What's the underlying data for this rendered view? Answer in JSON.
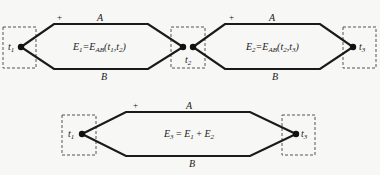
{
  "colors": {
    "wire": "#1a1a1a",
    "box_dash": "#555555",
    "background": "#f7f7f5"
  },
  "thermocouples": [
    {
      "id": "top-left",
      "wire_top": "A",
      "wire_bottom": "B",
      "polarity": "+",
      "equation": {
        "lhs": "E",
        "lhs_sub": "1",
        "rhs": "E",
        "rhs_sub": "AB",
        "args": [
          "t",
          "1",
          "t",
          "2"
        ]
      },
      "junctions": [
        {
          "label": "t",
          "sub": "1"
        },
        {
          "label": "t",
          "sub": "2"
        }
      ]
    },
    {
      "id": "top-right",
      "wire_top": "A",
      "wire_bottom": "B",
      "polarity": "+",
      "equation": {
        "lhs": "E",
        "lhs_sub": "2",
        "rhs": "E",
        "rhs_sub": "AB",
        "args": [
          "t",
          "2",
          "t",
          "3"
        ]
      },
      "junctions": [
        {
          "label": "t",
          "sub": "2"
        },
        {
          "label": "t",
          "sub": "3"
        }
      ]
    },
    {
      "id": "bottom",
      "wire_top": "A",
      "wire_bottom": "B",
      "polarity": "+",
      "equation": {
        "text_lhs": "E",
        "lhs_sub": "3",
        "term1": "E",
        "term1_sub": "1",
        "term2": "E",
        "term2_sub": "2",
        "equals": " = ",
        "plus": " + "
      },
      "junctions": [
        {
          "label": "t",
          "sub": "1"
        },
        {
          "label": "t",
          "sub": "3"
        }
      ]
    }
  ]
}
